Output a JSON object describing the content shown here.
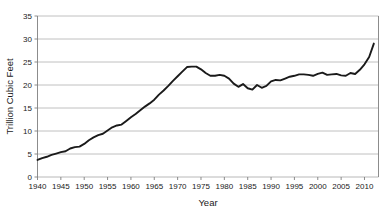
{
  "chart_data": {
    "type": "line",
    "title": "",
    "xlabel": "Year",
    "ylabel": "Trillion Cubic Feet",
    "xlim": [
      1940,
      2013
    ],
    "ylim": [
      0,
      35
    ],
    "ytick_step": 5,
    "xtick_step": 5,
    "grid": true,
    "legend": false,
    "line_color": "#1a1a1a",
    "grid_color": "#b0b0b0",
    "axis_color": "#7f7f7f",
    "yticks": [
      0,
      5,
      10,
      15,
      20,
      25,
      30,
      35
    ],
    "xticks": [
      1940,
      1945,
      1950,
      1955,
      1960,
      1965,
      1970,
      1975,
      1980,
      1985,
      1990,
      1995,
      2000,
      2005,
      2010
    ],
    "x": [
      1940,
      1941,
      1942,
      1943,
      1944,
      1945,
      1946,
      1947,
      1948,
      1949,
      1950,
      1951,
      1952,
      1953,
      1954,
      1955,
      1956,
      1957,
      1958,
      1959,
      1960,
      1961,
      1962,
      1963,
      1964,
      1965,
      1966,
      1967,
      1968,
      1969,
      1970,
      1971,
      1972,
      1973,
      1974,
      1975,
      1976,
      1977,
      1978,
      1979,
      1980,
      1981,
      1982,
      1983,
      1984,
      1985,
      1986,
      1987,
      1988,
      1989,
      1990,
      1991,
      1992,
      1993,
      1994,
      1995,
      1996,
      1997,
      1998,
      1999,
      2000,
      2001,
      2002,
      2003,
      2004,
      2005,
      2006,
      2007,
      2008,
      2009,
      2010,
      2011,
      2012
    ],
    "values": [
      3.7,
      4.1,
      4.4,
      4.8,
      5.1,
      5.4,
      5.6,
      6.2,
      6.5,
      6.6,
      7.2,
      8.0,
      8.6,
      9.1,
      9.4,
      10.1,
      10.8,
      11.2,
      11.4,
      12.2,
      13.0,
      13.7,
      14.5,
      15.3,
      16.0,
      16.8,
      17.9,
      18.8,
      19.8,
      20.9,
      21.9,
      22.9,
      23.9,
      24.0,
      24.0,
      23.4,
      22.6,
      22.0,
      22.0,
      22.2,
      22.0,
      21.4,
      20.3,
      19.6,
      20.2,
      19.3,
      19.0,
      20.0,
      19.4,
      19.8,
      20.8,
      21.1,
      21.0,
      21.4,
      21.8,
      22.0,
      22.3,
      22.3,
      22.2,
      22.0,
      22.4,
      22.7,
      22.2,
      22.3,
      22.4,
      22.1,
      22.0,
      22.6,
      22.4,
      23.3,
      24.5,
      26.1,
      29.0
    ]
  }
}
